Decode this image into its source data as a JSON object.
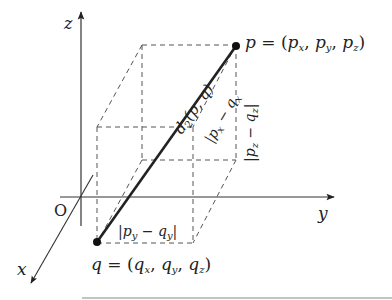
{
  "diagram": {
    "axes": {
      "z": {
        "label": "z"
      },
      "y": {
        "label": "y"
      },
      "x": {
        "label": "x"
      },
      "origin": {
        "label": "O"
      }
    },
    "points": {
      "p": {
        "name": "p",
        "coords_label": "(p",
        "components": [
          "x",
          "y",
          "z"
        ],
        "full_label": "p = (p_x, p_y, p_z)"
      },
      "q": {
        "name": "q",
        "coords_label": "(q",
        "components": [
          "x",
          "y",
          "z"
        ],
        "full_label": "q = (q_x, q_y, q_z)"
      }
    },
    "segment_label": {
      "main": "d",
      "sub": "2",
      "args": "(p, q)"
    },
    "dimension_labels": {
      "dx": {
        "text_a": "|p",
        "sub_a": "x",
        "minus": " − q",
        "sub_b": "x",
        "end": "|"
      },
      "dy": {
        "text_a": "|p",
        "sub_a": "y",
        "minus": " − q",
        "sub_b": "y",
        "end": "|"
      },
      "dz": {
        "text_a": "|p",
        "sub_a": "z",
        "minus": " − q",
        "sub_b": "z",
        "end": "|"
      }
    },
    "colors": {
      "line": "#222222",
      "dashed": "#555555",
      "axis": "#333333"
    }
  }
}
